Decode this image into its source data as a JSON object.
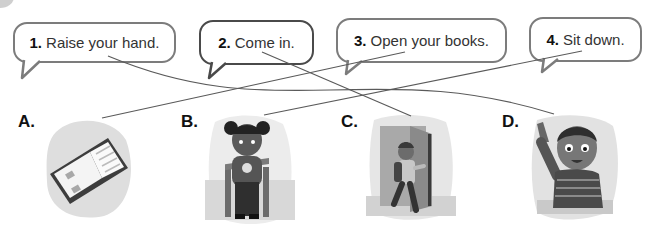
{
  "exercise": {
    "sentences": [
      {
        "number": "1.",
        "text": "Raise your hand.",
        "match": "D"
      },
      {
        "number": "2.",
        "text": "Come in.",
        "match": "C"
      },
      {
        "number": "3.",
        "text": "Open your books.",
        "match": "A"
      },
      {
        "number": "4.",
        "text": "Sit down.",
        "match": "B"
      }
    ],
    "pictures": [
      {
        "label": "A.",
        "depicts": "open book"
      },
      {
        "label": "B.",
        "depicts": "girl sitting on chair"
      },
      {
        "label": "C.",
        "depicts": "boy walking through door"
      },
      {
        "label": "D.",
        "depicts": "boy raising hand"
      }
    ]
  },
  "colors": {
    "bubble_border": "#7c7c7c",
    "bubble_border_dark": "#4a4a4a",
    "match_line": "#5a5a5a",
    "picture_bg": "#e4e4e4"
  }
}
